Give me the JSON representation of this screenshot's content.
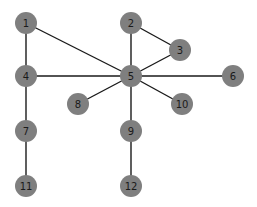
{
  "graph": {
    "style": {
      "node_fill": "#7f7f7f",
      "edge_color": "#1a1a1a",
      "label_color": "#1a1a1a",
      "node_radius": 11,
      "background": "#ffffff"
    },
    "nodes": [
      {
        "id": "1",
        "label": "1",
        "x": 26,
        "y": 23
      },
      {
        "id": "2",
        "label": "2",
        "x": 131,
        "y": 23
      },
      {
        "id": "3",
        "label": "3",
        "x": 180,
        "y": 50
      },
      {
        "id": "4",
        "label": "4",
        "x": 26,
        "y": 76
      },
      {
        "id": "5",
        "label": "5",
        "x": 131,
        "y": 76
      },
      {
        "id": "6",
        "label": "6",
        "x": 233,
        "y": 76
      },
      {
        "id": "7",
        "label": "7",
        "x": 26,
        "y": 131
      },
      {
        "id": "8",
        "label": "8",
        "x": 78,
        "y": 104
      },
      {
        "id": "9",
        "label": "9",
        "x": 131,
        "y": 131
      },
      {
        "id": "10",
        "label": "10",
        "x": 182,
        "y": 104
      },
      {
        "id": "11",
        "label": "11",
        "x": 26,
        "y": 186
      },
      {
        "id": "12",
        "label": "12",
        "x": 131,
        "y": 186
      }
    ],
    "edges": [
      [
        "1",
        "4"
      ],
      [
        "1",
        "5"
      ],
      [
        "2",
        "5"
      ],
      [
        "2",
        "3"
      ],
      [
        "3",
        "5"
      ],
      [
        "4",
        "5"
      ],
      [
        "5",
        "6"
      ],
      [
        "5",
        "8"
      ],
      [
        "5",
        "9"
      ],
      [
        "5",
        "10"
      ],
      [
        "4",
        "7"
      ],
      [
        "7",
        "11"
      ],
      [
        "9",
        "12"
      ]
    ]
  }
}
